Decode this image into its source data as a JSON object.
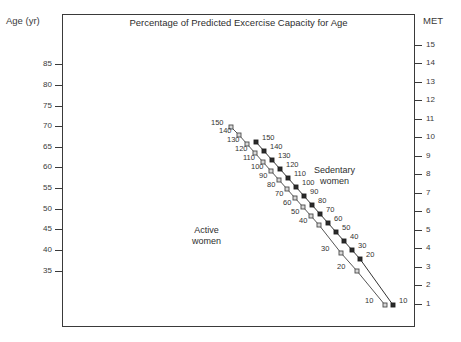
{
  "chart_data": {
    "type": "line",
    "title": "Percentage of Predicted Excercise Capacity for Age",
    "xlabel": "",
    "ylabel": "Age (yr)",
    "y2label": "MET",
    "grid": false,
    "legend_position": "inside-plot",
    "yticks": [
      85,
      80,
      75,
      70,
      65,
      60,
      55,
      50,
      45,
      40,
      35
    ],
    "ylim": [
      32,
      90
    ],
    "y2ticks": [
      15,
      14,
      13,
      12,
      11,
      10,
      9,
      8,
      7,
      6,
      5,
      4,
      3,
      2,
      1
    ],
    "y2lim": [
      0.6,
      15.8
    ],
    "annotations": [
      {
        "text": "Sedentary\nwomen",
        "line1": "Sedentary",
        "line2": "women"
      },
      {
        "text": "Active\nwomen",
        "line1": "Active",
        "line2": "women"
      }
    ],
    "series": [
      {
        "name": "Active women",
        "color": "#555555",
        "marker": "square-open",
        "point_labels": [
          "150",
          "140",
          "130",
          "120",
          "110",
          "100",
          "90",
          "80",
          "70",
          "60",
          "50",
          "40",
          "30",
          "20",
          "10"
        ],
        "points": [
          {
            "label": "150",
            "age": 68.5,
            "met": 10.6,
            "px": 231,
            "py": 127
          },
          {
            "label": "140",
            "age": 66.5,
            "met": 10.0,
            "px": 239,
            "py": 135
          },
          {
            "label": "130",
            "age": 64.3,
            "met": 9.4,
            "px": 247,
            "py": 144
          },
          {
            "label": "120",
            "age": 62.1,
            "met": 8.8,
            "px": 255,
            "py": 153
          },
          {
            "label": "110",
            "age": 59.9,
            "met": 8.2,
            "px": 263,
            "py": 162
          },
          {
            "label": "100",
            "age": 57.7,
            "met": 7.6,
            "px": 271,
            "py": 171
          },
          {
            "label": "90",
            "age": 55.5,
            "met": 7.0,
            "px": 279,
            "py": 180
          },
          {
            "label": "80",
            "age": 53.3,
            "met": 6.4,
            "px": 287,
            "py": 189
          },
          {
            "label": "70",
            "age": 51.1,
            "met": 5.8,
            "px": 295,
            "py": 198
          },
          {
            "label": "60",
            "age": 48.9,
            "met": 5.2,
            "px": 303,
            "py": 207
          },
          {
            "label": "50",
            "age": 46.7,
            "met": 4.6,
            "px": 311,
            "py": 216
          },
          {
            "label": "40",
            "age": 44.5,
            "met": 4.0,
            "px": 319,
            "py": 225
          },
          {
            "label": "30",
            "age": 42.3,
            "met": 3.4,
            "px": 341,
            "py": 253
          },
          {
            "label": "20",
            "age": 40.1,
            "met": 2.8,
            "px": 357,
            "py": 271
          },
          {
            "label": "10",
            "age": 37.9,
            "met": 1.2,
            "px": 385,
            "py": 305
          }
        ]
      },
      {
        "name": "Sedentary women",
        "color": "#333333",
        "marker": "square-filled",
        "point_labels": [
          "150",
          "140",
          "130",
          "120",
          "110",
          "100",
          "90",
          "80",
          "70",
          "60",
          "50",
          "40",
          "30",
          "20",
          "10"
        ],
        "points": [
          {
            "label": "150",
            "age": 66.5,
            "met": 10.0,
            "px": 256,
            "py": 142
          },
          {
            "label": "140",
            "age": 64.3,
            "met": 9.4,
            "px": 264,
            "py": 151
          },
          {
            "label": "130",
            "age": 62.1,
            "met": 8.8,
            "px": 272,
            "py": 160
          },
          {
            "label": "120",
            "age": 59.9,
            "met": 8.2,
            "px": 280,
            "py": 169
          },
          {
            "label": "110",
            "age": 57.7,
            "met": 7.6,
            "px": 288,
            "py": 178
          },
          {
            "label": "100",
            "age": 55.5,
            "met": 7.0,
            "px": 296,
            "py": 187
          },
          {
            "label": "90",
            "age": 53.3,
            "met": 6.4,
            "px": 304,
            "py": 196
          },
          {
            "label": "80",
            "age": 51.1,
            "met": 5.8,
            "px": 312,
            "py": 205
          },
          {
            "label": "70",
            "age": 48.9,
            "met": 5.2,
            "px": 320,
            "py": 214
          },
          {
            "label": "60",
            "age": 46.7,
            "met": 4.6,
            "px": 328,
            "py": 223
          },
          {
            "label": "50",
            "age": 44.5,
            "met": 4.0,
            "px": 336,
            "py": 232
          },
          {
            "label": "40",
            "age": 42.3,
            "met": 3.4,
            "px": 344,
            "py": 241
          },
          {
            "label": "30",
            "age": 40.1,
            "met": 2.8,
            "px": 352,
            "py": 250
          },
          {
            "label": "20",
            "age": 37.9,
            "met": 2.2,
            "px": 360,
            "py": 259
          },
          {
            "label": "10",
            "age": 35.5,
            "met": 1.2,
            "px": 393,
            "py": 305
          }
        ]
      }
    ]
  },
  "axes": {
    "left": {
      "title": "Age (yr)",
      "ticks": [
        {
          "label": "85",
          "y": 64
        },
        {
          "label": "80",
          "y": 85
        },
        {
          "label": "75",
          "y": 106
        },
        {
          "label": "70",
          "y": 126
        },
        {
          "label": "65",
          "y": 147
        },
        {
          "label": "60",
          "y": 167
        },
        {
          "label": "55",
          "y": 188
        },
        {
          "label": "50",
          "y": 209
        },
        {
          "label": "45",
          "y": 229
        },
        {
          "label": "40",
          "y": 250
        },
        {
          "label": "35",
          "y": 271
        }
      ]
    },
    "right": {
      "title": "MET",
      "ticks": [
        {
          "label": "15",
          "y": 45
        },
        {
          "label": "14",
          "y": 63
        },
        {
          "label": "13",
          "y": 82
        },
        {
          "label": "12",
          "y": 100
        },
        {
          "label": "11",
          "y": 119
        },
        {
          "label": "10",
          "y": 137
        },
        {
          "label": "9",
          "y": 156
        },
        {
          "label": "8",
          "y": 174
        },
        {
          "label": "7",
          "y": 193
        },
        {
          "label": "6",
          "y": 211
        },
        {
          "label": "5",
          "y": 230
        },
        {
          "label": "4",
          "y": 248
        },
        {
          "label": "3",
          "y": 267
        },
        {
          "label": "2",
          "y": 285
        },
        {
          "label": "1",
          "y": 304
        }
      ]
    }
  },
  "annotations": {
    "sedentary": {
      "line1": "Sedentary",
      "line2": "women"
    },
    "active": {
      "line1": "Active",
      "line2": "women"
    }
  },
  "point_label_offsets": {
    "active": {
      "dx": -20,
      "dy": -4
    },
    "sedentary": {
      "dx": 6,
      "dy": -4
    }
  },
  "colors": {
    "frame": "#3a3a3a",
    "text": "#2e2e2e",
    "active_series": "#555555",
    "sedentary_series": "#333333",
    "background": "#ffffff"
  }
}
